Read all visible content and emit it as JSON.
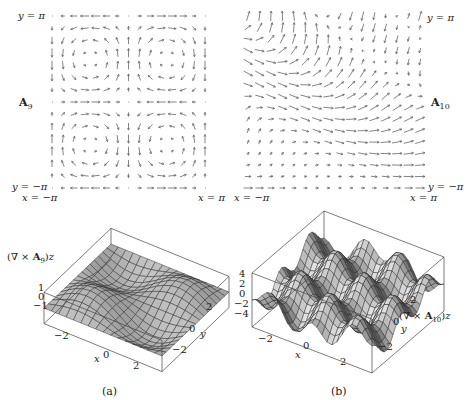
{
  "figure": {
    "panels": [
      {
        "id": "a",
        "caption": "(a)",
        "field_label": "A9",
        "field_label_main": "A",
        "field_label_sub": "9",
        "y_top_label": "y = π",
        "y_bottom_label": "y = −π",
        "x_left_label": "x = −π",
        "x_right_label": "x = π",
        "surface_label": "(∇ × A9)z",
        "surface_z_ticks": [
          "1",
          "0",
          "−1"
        ],
        "surface_x_ticks": [
          "−2",
          "0",
          "2"
        ],
        "surface_y_ticks": [
          "2",
          "0",
          "−2"
        ],
        "surface_x_axis": "x",
        "surface_y_axis": "y"
      },
      {
        "id": "b",
        "caption": "(b)",
        "field_label": "A10",
        "field_label_main": "A",
        "field_label_sub": "10",
        "y_top_label": "y = π",
        "y_bottom_label": "y = −π",
        "x_left_label": "x = −π",
        "x_right_label": "x = π",
        "surface_label": "(∇ × A10)z",
        "surface_z_ticks": [
          "4",
          "2",
          "0",
          "−2",
          "−4"
        ],
        "surface_x_ticks": [
          "−2",
          "0",
          "2"
        ],
        "surface_y_ticks": [
          "2",
          "0",
          "−2"
        ],
        "surface_x_axis": "x",
        "surface_y_axis": "y"
      }
    ]
  }
}
